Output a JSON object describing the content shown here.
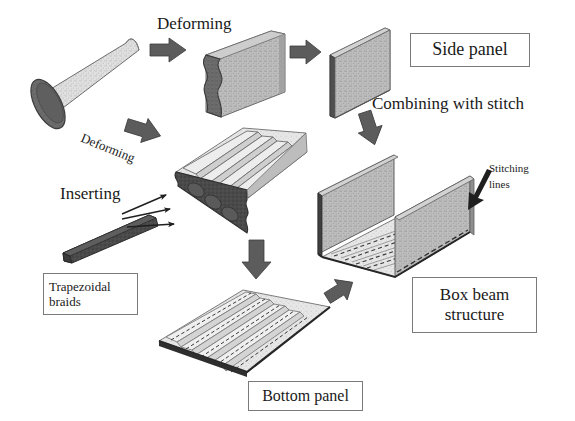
{
  "figure": {
    "title_implicit": "Manufacturing process of a composite box beam structure",
    "background_color": "#ffffff",
    "ink_color": "#1a1a1a"
  },
  "palette": {
    "tube_light": "#d9d9d9",
    "tube_dark_face": "#6e6e6e",
    "panel_gray": "#b3b3b3",
    "panel_gray_dark": "#8c8c8c",
    "corrugated_light": "#e2e2e2",
    "corrugated_shade": "#c6c6c6",
    "braid_dark": "#4a4a4a",
    "arrow_gray": "#5c5c5c",
    "edge_dark": "#2b2b2b",
    "stitch_dash": "#3a3a3a",
    "label_border": "#7a7a7a"
  },
  "process_labels": [
    {
      "id": "deforming-top",
      "text": "Deforming",
      "x": 157,
      "y": 22,
      "size": 17
    },
    {
      "id": "deforming-lower",
      "text": "Deforming",
      "x": 84,
      "y": 138,
      "size": 13,
      "rotate": 22
    },
    {
      "id": "inserting",
      "text": "Inserting",
      "x": 60,
      "y": 192,
      "size": 17
    },
    {
      "id": "combining",
      "text": "Combining with stitch",
      "x": 372,
      "y": 102,
      "size": 17
    },
    {
      "id": "stitching-lines-1",
      "text": "Stitching",
      "x": 486,
      "y": 168,
      "size": 11
    },
    {
      "id": "stitching-lines-2",
      "text": "lines",
      "x": 486,
      "y": 184,
      "size": 11
    }
  ],
  "boxed_labels": [
    {
      "id": "side-panel",
      "lines": [
        "Side panel"
      ],
      "align": "center",
      "x": 410,
      "y": 33,
      "w": 120,
      "h": 34,
      "size": 18
    },
    {
      "id": "trapezoidal-braids",
      "lines": [
        "Trapezoidal",
        "braids"
      ],
      "align": "left",
      "x": 43,
      "y": 273,
      "w": 95,
      "h": 42,
      "size": 13
    },
    {
      "id": "box-beam-structure",
      "lines": [
        "Box beam",
        "structure"
      ],
      "align": "center",
      "x": 412,
      "y": 277,
      "w": 125,
      "h": 56,
      "size": 17
    },
    {
      "id": "bottom-panel",
      "lines": [
        "Bottom panel"
      ],
      "align": "center",
      "x": 248,
      "y": 381,
      "w": 115,
      "h": 30,
      "size": 16
    }
  ],
  "block_arrows": [
    {
      "id": "arrow-tube-to-deformed",
      "x": 152,
      "y": 48,
      "len": 34,
      "thick": 16,
      "angle": 0,
      "label_ref": "deforming-top"
    },
    {
      "id": "arrow-deformed-to-side",
      "x": 288,
      "y": 52,
      "len": 30,
      "thick": 15,
      "angle": 0,
      "label_ref": null
    },
    {
      "id": "arrow-tube-to-corrugated",
      "x": 128,
      "y": 118,
      "len": 34,
      "thick": 16,
      "angle": 18,
      "label_ref": "deforming-lower"
    },
    {
      "id": "arrow-side-to-boxbeam",
      "x": 360,
      "y": 110,
      "len": 32,
      "thick": 16,
      "angle": 75,
      "label_ref": "combining"
    },
    {
      "id": "arrow-corrugated-to-bottom",
      "x": 255,
      "y": 250,
      "len": 34,
      "thick": 17,
      "angle": 90,
      "label_ref": null
    },
    {
      "id": "arrow-bottom-to-boxbeam",
      "x": 318,
      "y": 283,
      "len": 28,
      "thick": 14,
      "angle": -35,
      "label_ref": null
    }
  ],
  "thin_arrows": [
    {
      "id": "insert-arrow-a",
      "x1": 122,
      "y1": 215,
      "x2": 168,
      "y2": 196
    },
    {
      "id": "insert-arrow-b",
      "x1": 122,
      "y1": 218,
      "x2": 172,
      "y2": 210
    },
    {
      "id": "insert-arrow-c",
      "x1": 126,
      "y1": 226,
      "x2": 176,
      "y2": 224
    },
    {
      "id": "stitch-pointer",
      "x1": 488,
      "y1": 176,
      "x2": 466,
      "y2": 206
    }
  ],
  "shapes": [
    {
      "id": "braided-tube",
      "name": "braided-preform-tube",
      "description": "Light gray braided cylindrical preform tilted diagonally with dark elliptical open end at lower-left"
    },
    {
      "id": "deformed-s-panel",
      "name": "deformed-s-section-panel",
      "description": "Flattened panel with wavy S-curved dark end face"
    },
    {
      "id": "side-panel-slab",
      "name": "side-panel-slab",
      "description": "Flat rectangular side panel slab in isometric view"
    },
    {
      "id": "corrugated-panel",
      "name": "corrugated-panel-with-braids",
      "description": "Corrugated panel with four ridges and dark wavy inserted braid end face"
    },
    {
      "id": "trapezoidal-braid-bar",
      "name": "trapezoidal-braid-bar",
      "description": "Dark elongated trapezoidal braid bar being inserted"
    },
    {
      "id": "bottom-panel-stitched",
      "name": "bottom-panel-stitched",
      "description": "Corrugated bottom panel with dashed stitching lines along each rib"
    },
    {
      "id": "box-beam",
      "name": "box-beam-u-channel",
      "description": "U-channel box beam with two vertical side panels stitched to a corrugated bottom panel"
    }
  ]
}
